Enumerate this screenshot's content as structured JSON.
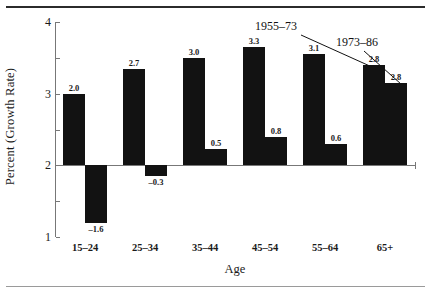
{
  "chart_data": {
    "type": "bar",
    "title": "",
    "xlabel": "Age",
    "ylabel": "Percent (Growth Rate)",
    "categories": [
      "15–24",
      "25–34",
      "35–44",
      "45–54",
      "55–64",
      "65+"
    ],
    "series": [
      {
        "name": "1955–73",
        "values": [
          2.0,
          2.7,
          3.0,
          3.3,
          3.1,
          2.8
        ],
        "labels": [
          "2.0",
          "2.7",
          "3.0",
          "3.3",
          "3.1",
          "2.8"
        ],
        "plotted": [
          2.0,
          2.7,
          3.0,
          3.3,
          3.1,
          2.8
        ]
      },
      {
        "name": "1973–86",
        "values": [
          -1.6,
          -0.3,
          0.5,
          0.8,
          0.6,
          2.8
        ],
        "labels": [
          "–1.6",
          "–0.3",
          "0.5",
          "0.8",
          "0.6",
          "2.8"
        ],
        "plotted": [
          -1.6,
          -0.3,
          0.45,
          0.78,
          0.6,
          2.3
        ]
      }
    ],
    "ylim": [
      -2,
      4
    ],
    "yticks": [
      4,
      3,
      2,
      1,
      0,
      -1,
      -2
    ],
    "ytick_labels": [
      "4",
      "3",
      "2",
      "1",
      "0",
      "–1",
      "–2"
    ],
    "grid": false,
    "legend": "none",
    "bar_color": "#121212",
    "annotations": [
      {
        "text": "1955–73",
        "target_group": 5,
        "target_series": 0
      },
      {
        "text": "1973–86",
        "target_group": 5,
        "target_series": 1
      }
    ]
  }
}
